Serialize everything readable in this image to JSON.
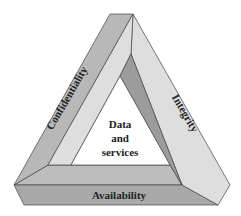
{
  "diagram": {
    "type": "impossible-triangle",
    "center_label": [
      "Data",
      "and",
      "services"
    ],
    "sides": {
      "left": "Confidentiality",
      "right": "Integrity",
      "bottom": "Availability"
    },
    "colors": {
      "left_face": "#b8b8b8",
      "light_face": "#dedede",
      "dark_face": "#9c9c9c",
      "bottom_face": "#a9a9a9",
      "bottom_top_face": "#bdbdbd",
      "edge": "#444444",
      "inner": "#ffffff"
    }
  }
}
